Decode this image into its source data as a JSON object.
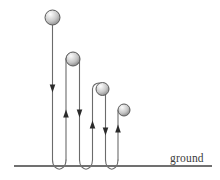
{
  "figure": {
    "background_color": "#ffffff",
    "path_color": "#6b6b6b",
    "arrow_color": "#2b2b2b",
    "ground_color": "#707070",
    "ball_outline_color": "#555555",
    "ball_highlight_color": "#ffffff",
    "ball_mid_color": "#d8d8d8",
    "ball_shadow_color": "#8e8e8e"
  },
  "ground": {
    "label": "ground",
    "label_x": 170,
    "label_y": 162,
    "line_y": 166,
    "line_x_start": 14,
    "line_x_end": 212,
    "color": "#707070"
  },
  "balls": [
    {
      "id": "ball-1",
      "cx": 52.5,
      "cy": 17.5,
      "r": 7.5,
      "label": "drop-ball"
    },
    {
      "id": "ball-2",
      "cx": 73.0,
      "cy": 59.0,
      "r": 7.0,
      "label": "bounce-1-peak-ball"
    },
    {
      "id": "ball-3",
      "cx": 102.5,
      "cy": 89.0,
      "r": 6.5,
      "label": "bounce-2-peak-ball"
    },
    {
      "id": "ball-4",
      "cx": 124.0,
      "cy": 110.0,
      "r": 6.0,
      "label": "bounce-3-peak-ball"
    }
  ],
  "path_segments": [
    {
      "id": "seg-fall-1",
      "direction": "down",
      "x": 52.5,
      "y_top": 25.0,
      "y_bottom": 160.0
    },
    {
      "id": "seg-rise-1",
      "direction": "up",
      "x": 66.0,
      "y_top": 59.0,
      "y_bottom": 160.0
    },
    {
      "id": "seg-fall-2",
      "direction": "down",
      "x": 79.5,
      "y_top": 59.0,
      "y_bottom": 160.0
    },
    {
      "id": "seg-rise-2",
      "direction": "up",
      "x": 92.5,
      "y_top": 89.0,
      "y_bottom": 160.0
    },
    {
      "id": "seg-fall-3",
      "direction": "down",
      "x": 105.5,
      "y_top": 89.0,
      "y_bottom": 160.0
    },
    {
      "id": "seg-rise-3",
      "direction": "up",
      "x": 118.0,
      "y_top": 110.0,
      "y_bottom": 160.0
    }
  ],
  "bounce_arcs": [
    {
      "id": "bounce-arc-1",
      "x_left": 52.5,
      "x_right": 66.0,
      "y_start": 160.0,
      "y_bottom": 168.0
    },
    {
      "id": "bounce-arc-2",
      "x_left": 79.5,
      "x_right": 92.5,
      "y_start": 160.0,
      "y_bottom": 168.0
    },
    {
      "id": "bounce-arc-3",
      "x_left": 105.5,
      "x_right": 118.0,
      "y_start": 160.0,
      "y_bottom": 168.0
    }
  ],
  "arrows": [
    {
      "id": "arrow-fall-1",
      "x": 52.5,
      "y": 88.0,
      "direction": "down"
    },
    {
      "id": "arrow-rise-1",
      "x": 66.0,
      "y": 114.0,
      "direction": "up"
    },
    {
      "id": "arrow-fall-2",
      "x": 79.5,
      "y": 113.0,
      "direction": "down"
    },
    {
      "id": "arrow-rise-2",
      "x": 92.5,
      "y": 125.0,
      "direction": "up"
    },
    {
      "id": "arrow-fall-3",
      "x": 105.5,
      "y": 131.0,
      "direction": "down"
    },
    {
      "id": "arrow-rise-3",
      "x": 118.0,
      "y": 129.0,
      "direction": "up"
    }
  ]
}
